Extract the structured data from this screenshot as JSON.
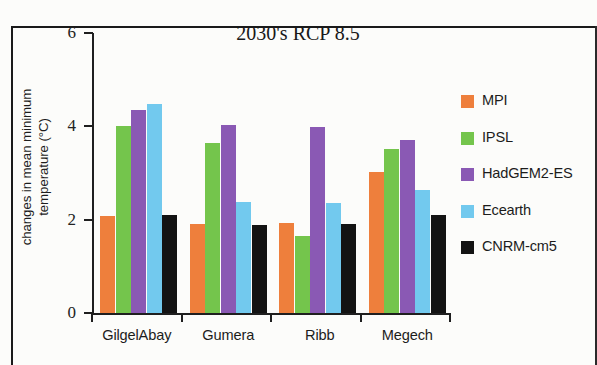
{
  "chart_data": {
    "type": "bar",
    "title": "2030's RCP 8.5",
    "xlabel": "",
    "ylabel": "changes in mean minimum\ntemperature (°C)",
    "categories": [
      "GilgelAbay",
      "Gumera",
      "Ribb",
      "Megech"
    ],
    "ylim": [
      0,
      6
    ],
    "yticks": [
      "0",
      "2",
      "4",
      "6"
    ],
    "ytick_values": [
      0,
      2,
      4,
      6
    ],
    "grid": false,
    "legend_position": "right",
    "series": [
      {
        "name": "MPI",
        "color": "#ee7f3c",
        "values": [
          2.08,
          1.9,
          1.93,
          3.03
        ]
      },
      {
        "name": "IPSL",
        "color": "#74c54c",
        "values": [
          4.0,
          3.65,
          1.65,
          3.52
        ]
      },
      {
        "name": "HadGEM2-ES",
        "color": "#8a59b4",
        "values": [
          4.35,
          4.03,
          3.99,
          3.7
        ]
      },
      {
        "name": "Ecearth",
        "color": "#72c9ee",
        "values": [
          4.47,
          2.38,
          2.35,
          2.64
        ]
      },
      {
        "name": "CNRM-cm5",
        "color": "#131313",
        "values": [
          2.11,
          1.88,
          1.9,
          2.11
        ]
      }
    ]
  },
  "legend": {
    "items": [
      {
        "label": "MPI"
      },
      {
        "label": "IPSL"
      },
      {
        "label": "HadGEM2-ES"
      },
      {
        "label": "Ecearth"
      },
      {
        "label": "CNRM-cm5"
      }
    ]
  }
}
